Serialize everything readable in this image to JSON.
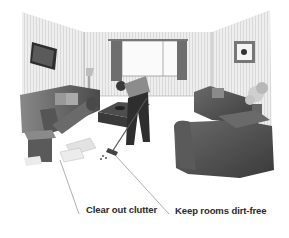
{
  "illustration": {
    "subject": "person sweeping living room floor",
    "style": "grayscale line illustration"
  },
  "labels": [
    {
      "text": "Clear out clutter",
      "x": 86,
      "y": 203
    },
    {
      "text": "Keep rooms dirt-free",
      "x": 175,
      "y": 204
    }
  ],
  "colors": {
    "background": "#ffffff",
    "wall": "#e4e4e4",
    "furniture": "#555555",
    "curtain": "#6e6e6e",
    "label_text": "#2a2a2a"
  }
}
